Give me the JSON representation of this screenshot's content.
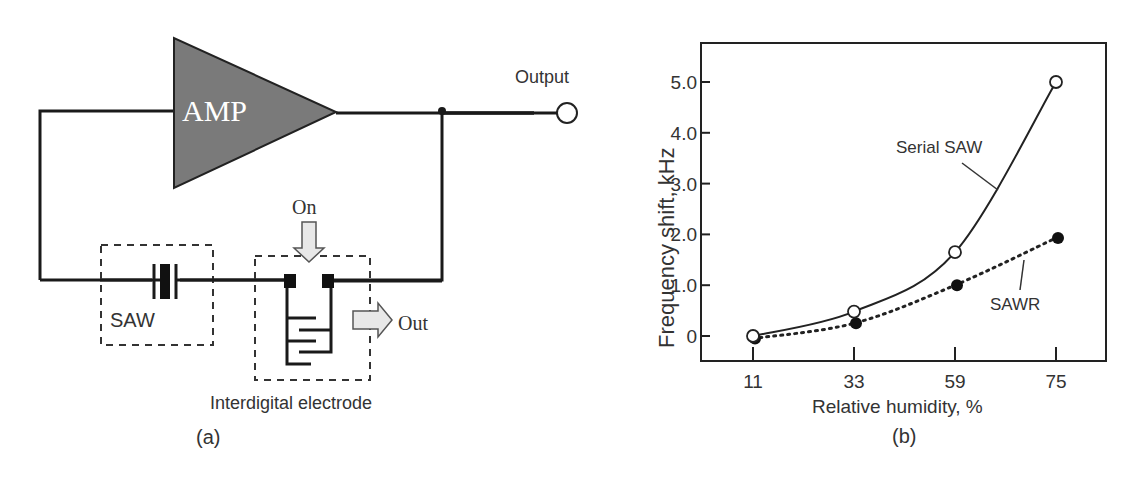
{
  "panel_a": {
    "amp_label": "AMP",
    "output_label": "Output",
    "saw_label": "SAW",
    "on_label": "On",
    "out_label": "Out",
    "electrode_label": "Interdigital electrode",
    "caption": "(a)",
    "colors": {
      "amp_fill": "#7a7a7a",
      "wire": "#1a1a1a",
      "arrow_fill": "#e8e8e8"
    }
  },
  "panel_b": {
    "caption": "(b)",
    "series_label_serial": "Serial SAW",
    "series_label_sawr": "SAWR"
  },
  "chart_data": {
    "type": "line",
    "title": "",
    "xlabel": "Relative humidity, %",
    "ylabel": "Frequency shift, kHz",
    "categories": [
      "11",
      "33",
      "59",
      "75"
    ],
    "x": [
      11,
      33,
      59,
      75
    ],
    "y_ticks": [
      "0",
      "1.0",
      "2.0",
      "3.0",
      "4.0",
      "5.0"
    ],
    "ylim": [
      -0.5,
      5.8
    ],
    "grid": false,
    "legend": "inline annotations",
    "series": [
      {
        "name": "Serial SAW",
        "marker": "open-circle",
        "line": "solid",
        "values": [
          0.0,
          0.48,
          1.65,
          5.0
        ]
      },
      {
        "name": "SAWR",
        "marker": "filled-circle",
        "line": "dotted",
        "values": [
          -0.05,
          0.25,
          1.0,
          1.93
        ]
      }
    ]
  }
}
